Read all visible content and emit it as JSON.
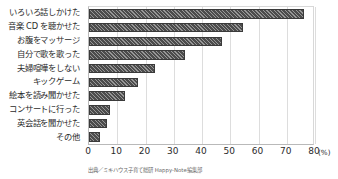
{
  "chart_data": {
    "type": "bar",
    "orientation": "horizontal",
    "title": "",
    "subtitle": "",
    "xlabel": "(%)",
    "ylabel": "",
    "xlim": [
      0,
      80
    ],
    "xticks": [
      0,
      10,
      20,
      30,
      40,
      50,
      60,
      70,
      80
    ],
    "xtick_labels": [
      "0",
      "10",
      "20",
      "30",
      "40",
      "50",
      "60",
      "70",
      "80"
    ],
    "unit_label": "(%)",
    "grid": true,
    "grid_axis": "x",
    "legend": false,
    "legend_position": "none",
    "bar_color": "#4c4c4c",
    "bar_pattern": "diagonal-hatch",
    "categories": [
      "いろいろ話しかけた",
      "音楽 CD を聴かせた",
      "お腹をマッサージ",
      "自分で歌を歌った",
      "夫婦喧嘩をしない",
      "キックゲーム",
      "絵本を読み聞かせた",
      "コンサートに行った",
      "英会話を聞かせた",
      "その他"
    ],
    "values": [
      76,
      54.5,
      47,
      34,
      23.5,
      17.2,
      12.8,
      7.3,
      6.3,
      4
    ],
    "annotations": []
  },
  "caption": {
    "source": "出典／ミキハウス子育て総研 Happy-Note編集部"
  }
}
